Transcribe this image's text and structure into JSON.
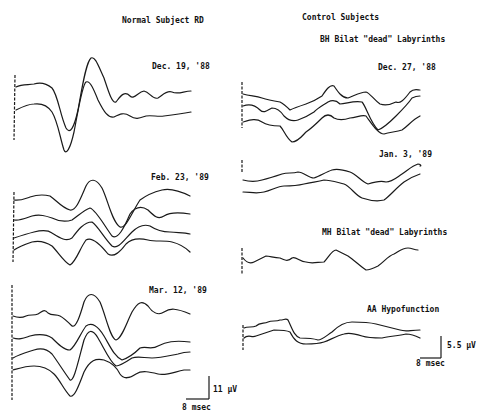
{
  "left_column": {
    "title": "Normal Subject   RD",
    "panels": [
      {
        "date": "Dec. 19, '88",
        "trace_count": 2
      },
      {
        "date": "Feb. 23, '89",
        "trace_count": 4
      },
      {
        "date": "Mar. 12, '89",
        "trace_count": 4
      }
    ],
    "scale_bar": {
      "amplitude": "11 µV",
      "time": "8 msec"
    }
  },
  "right_column": {
    "title": "Control Subjects",
    "panels": [
      {
        "subject": "BH Bilat \"dead\" Labyrinths",
        "date": "Dec. 27, '88",
        "trace_count": 3
      },
      {
        "subject": "",
        "date": "Jan. 3, '89",
        "trace_count": 2
      },
      {
        "subject": "MH Bilat \"dead\" Labyrinths",
        "date": "",
        "trace_count": 1
      },
      {
        "subject": "AA Hypofunction",
        "date": "",
        "trace_count": 2
      }
    ],
    "scale_bar": {
      "amplitude": "5.5 µV",
      "time": "8 msec"
    }
  },
  "colors": {
    "ink": "#1a1a1a",
    "background": "#ffffff"
  }
}
